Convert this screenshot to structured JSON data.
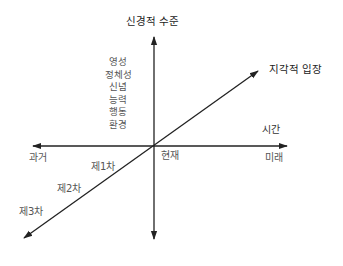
{
  "diagram": {
    "title_vertical_axis": "신경적 수준",
    "diagonal_axis_label": "지각적 입장",
    "time_axis_label": "시간",
    "past_label": "과거",
    "present_label": "현재",
    "future_label": "미래",
    "neurological_levels": [
      "영성",
      "정체성",
      "신념",
      "능력",
      "행동",
      "환경"
    ],
    "perceptual_positions": [
      "제1차",
      "제2차",
      "제3차"
    ],
    "colors": {
      "line": "#222222",
      "text": "#333333"
    }
  }
}
